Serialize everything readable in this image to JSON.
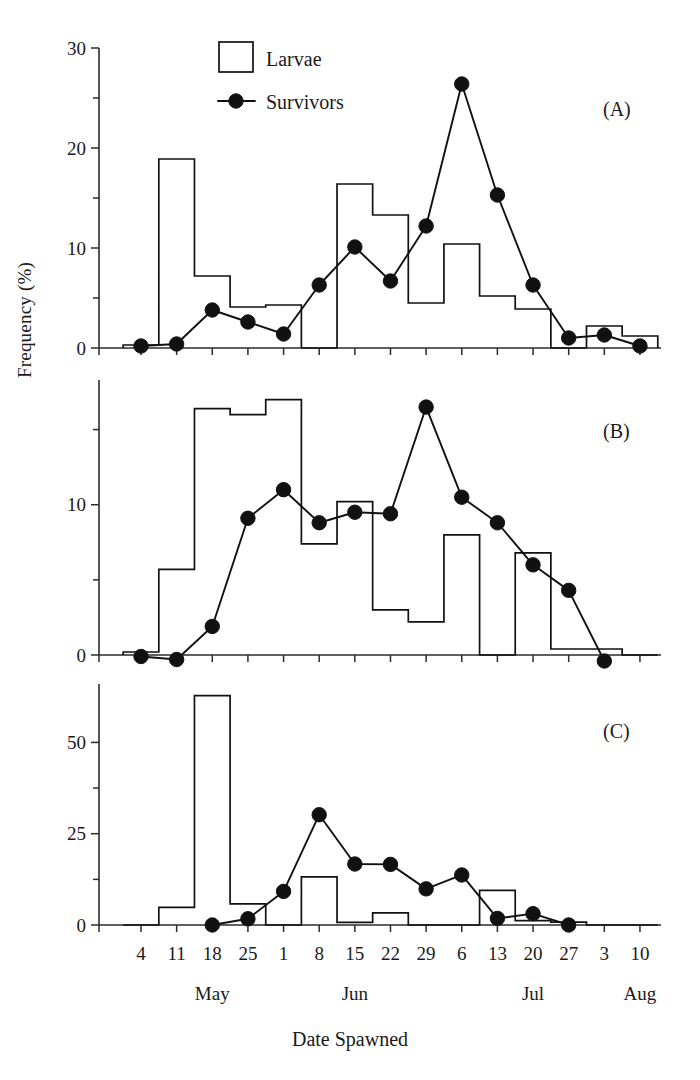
{
  "figure": {
    "ylabel": "Frequency (%)",
    "xlabel": "Date Spawned"
  },
  "legend": {
    "larvae_label": "Larvae",
    "survivors_label": "Survivors"
  },
  "panels": [
    {
      "tag": "(A)",
      "yticks": [
        "0",
        "10",
        "20",
        "30"
      ]
    },
    {
      "tag": "(B)",
      "yticks": [
        "0",
        "10"
      ]
    },
    {
      "tag": "(C)",
      "yticks": [
        "0",
        "25",
        "50"
      ]
    }
  ],
  "xaxis": {
    "ticklabels": [
      "4",
      "11",
      "18",
      "25",
      "1",
      "8",
      "15",
      "22",
      "29",
      "6",
      "13",
      "20",
      "27",
      "3",
      "10"
    ],
    "months": [
      {
        "name": "May",
        "at_index": 2
      },
      {
        "name": "Jun",
        "at_index": 6
      },
      {
        "name": "Jul",
        "at_index": 11
      },
      {
        "name": "Aug",
        "at_index": 14
      }
    ]
  },
  "chart_data": [
    {
      "type": "bar",
      "panel": "(A)",
      "title": "",
      "xlabel": "Date Spawned",
      "ylabel": "Frequency (%)",
      "categories": [
        "4",
        "11",
        "18",
        "25",
        "1",
        "8",
        "15",
        "22",
        "29",
        "6",
        "13",
        "20",
        "27",
        "3",
        "10"
      ],
      "ylim": [
        0,
        30
      ],
      "yticks": [
        0,
        10,
        20,
        30
      ],
      "minor_yticks": [
        5,
        15,
        25
      ],
      "grid": false,
      "legend_position": "top-center",
      "series": [
        {
          "name": "Larvae",
          "kind": "bar",
          "values": [
            0.3,
            18.9,
            7.2,
            4.1,
            4.3,
            0.0,
            16.4,
            13.3,
            4.5,
            10.4,
            5.2,
            3.9,
            0.0,
            2.2,
            1.2
          ]
        },
        {
          "name": "Survivors",
          "kind": "line",
          "values": [
            0.2,
            0.4,
            3.8,
            2.6,
            1.4,
            6.3,
            10.1,
            6.7,
            12.2,
            26.4,
            15.3,
            6.3,
            1.0,
            1.3,
            0.2
          ]
        }
      ]
    },
    {
      "type": "bar",
      "panel": "(B)",
      "title": "",
      "xlabel": "Date Spawned",
      "ylabel": "Frequency (%)",
      "categories": [
        "4",
        "11",
        "18",
        "25",
        "1",
        "8",
        "15",
        "22",
        "29",
        "6",
        "13",
        "20",
        "27",
        "3",
        "10"
      ],
      "ylim": [
        0,
        18.3
      ],
      "yticks": [
        0,
        10
      ],
      "minor_yticks": [
        5,
        15
      ],
      "grid": false,
      "legend_position": "none",
      "series": [
        {
          "name": "Larvae",
          "kind": "bar",
          "values": [
            0.2,
            5.7,
            16.4,
            16.0,
            17.0,
            7.4,
            10.2,
            3.0,
            2.2,
            8.0,
            0.0,
            6.8,
            0.4,
            0.4,
            0.0
          ]
        },
        {
          "name": "Survivors",
          "kind": "line",
          "values": [
            -0.1,
            -0.3,
            1.9,
            9.1,
            11.0,
            8.8,
            9.5,
            9.4,
            16.5,
            10.5,
            8.8,
            6.0,
            4.3,
            -0.4,
            null
          ]
        }
      ]
    },
    {
      "type": "bar",
      "panel": "(C)",
      "title": "",
      "xlabel": "Date Spawned",
      "ylabel": "Frequency (%)",
      "categories": [
        "4",
        "11",
        "18",
        "25",
        "1",
        "8",
        "15",
        "22",
        "29",
        "6",
        "13",
        "20",
        "27",
        "3",
        "10"
      ],
      "ylim": [
        0,
        66
      ],
      "yticks": [
        0,
        25,
        50
      ],
      "minor_yticks": [
        12.5,
        37.5
      ],
      "grid": false,
      "legend_position": "none",
      "series": [
        {
          "name": "Larvae",
          "kind": "bar",
          "values": [
            0.0,
            4.8,
            62.8,
            5.8,
            0.0,
            13.2,
            0.7,
            3.3,
            0.0,
            0.0,
            9.5,
            1.2,
            0.8,
            0.0,
            0.0
          ]
        },
        {
          "name": "Survivors",
          "kind": "line",
          "values": [
            null,
            null,
            0.0,
            1.7,
            9.2,
            30.2,
            16.7,
            16.6,
            9.9,
            13.7,
            1.8,
            3.1,
            0.0,
            null,
            null
          ]
        }
      ]
    }
  ]
}
